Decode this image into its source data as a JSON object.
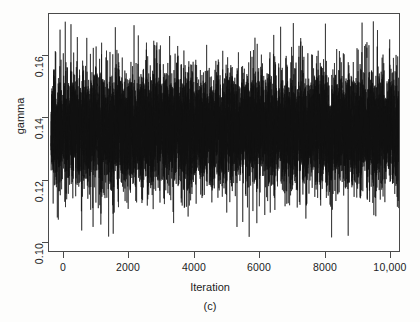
{
  "chart_data": {
    "type": "line",
    "title": "",
    "subcaption": "(c)",
    "xlabel": "Iteration",
    "ylabel": "gamma",
    "grid": false,
    "legend": null,
    "xlim": [
      0,
      10000
    ],
    "ylim": [
      0.0955,
      0.1745
    ],
    "xticks": [
      0,
      2000,
      4000,
      6000,
      8000,
      10000
    ],
    "xticklabels": [
      "0",
      "2000",
      "4000",
      "6000",
      "8000",
      "10,000"
    ],
    "yticks": [
      0.1,
      0.12,
      0.14,
      0.16
    ],
    "yticklabels": [
      "0.10",
      "0.12",
      "0.14",
      "0.16"
    ],
    "line_color": "#111111",
    "series": [
      {
        "name": "gamma",
        "description": "MCMC trace of gamma over 10000 iterations",
        "n_points": 10000,
        "mean": 0.1365,
        "sd": 0.0098,
        "min": 0.1005,
        "max": 0.1722,
        "dense_band": [
          0.125,
          0.1485
        ]
      }
    ]
  },
  "axes": {
    "y_tick_labels": [
      "0.16",
      "0.14",
      "0.12",
      "0.10"
    ],
    "x_tick_labels": [
      "0",
      "2000",
      "4000",
      "6000",
      "8000",
      "10,000"
    ]
  },
  "labels": {
    "y_axis_title": "gamma",
    "x_axis_title": "Iteration",
    "figure_caption": "(c)"
  }
}
